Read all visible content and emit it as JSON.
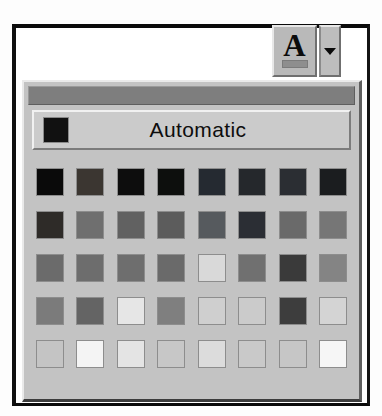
{
  "window": {
    "type": "font-color-palette-dropdown"
  },
  "toolbar": {
    "font_color_button": {
      "glyph": "A",
      "name": "font-color-button",
      "underline_color": "#8e8e8e"
    },
    "dropdown_arrow": {
      "icon": "caret-down-icon"
    }
  },
  "palette": {
    "grip_label": "",
    "automatic": {
      "label": "Automatic",
      "swatch_color": "#111111"
    },
    "grid": {
      "columns": 8,
      "rows": 5,
      "swatches": [
        [
          {
            "color": "#0a0a0a",
            "name": "swatch-black"
          },
          {
            "color": "#3b3631",
            "name": "swatch-dark-brown"
          },
          {
            "color": "#0d0d0d",
            "name": "swatch-olive-dark"
          },
          {
            "color": "#0d0f0d",
            "name": "swatch-dark-green"
          },
          {
            "color": "#252a31",
            "name": "swatch-dark-teal"
          },
          {
            "color": "#25282c",
            "name": "swatch-dark-blue"
          },
          {
            "color": "#2b2e33",
            "name": "swatch-indigo"
          },
          {
            "color": "#1b1d1f",
            "name": "swatch-gray-80"
          }
        ],
        [
          {
            "color": "#2e2b28",
            "name": "swatch-dark-red"
          },
          {
            "color": "#6f6f6f",
            "name": "swatch-orange"
          },
          {
            "color": "#616161",
            "name": "swatch-dark-yellow"
          },
          {
            "color": "#5c5c5c",
            "name": "swatch-green"
          },
          {
            "color": "#565a5e",
            "name": "swatch-teal"
          },
          {
            "color": "#2b2e34",
            "name": "swatch-blue"
          },
          {
            "color": "#6a6a6a",
            "name": "swatch-blue-gray"
          },
          {
            "color": "#767676",
            "name": "swatch-gray-50"
          }
        ],
        [
          {
            "color": "#6b6b6b",
            "name": "swatch-red"
          },
          {
            "color": "#6d6d6d",
            "name": "swatch-light-orange"
          },
          {
            "color": "#6e6e6e",
            "name": "swatch-lime"
          },
          {
            "color": "#6a6a6a",
            "name": "swatch-sea-green"
          },
          {
            "color": "#d9d9d9",
            "name": "swatch-aqua"
          },
          {
            "color": "#707070",
            "name": "swatch-light-blue"
          },
          {
            "color": "#3a3a3a",
            "name": "swatch-violet"
          },
          {
            "color": "#848484",
            "name": "swatch-gray-40"
          }
        ],
        [
          {
            "color": "#7b7b7b",
            "name": "swatch-pink"
          },
          {
            "color": "#646464",
            "name": "swatch-gold"
          },
          {
            "color": "#e6e6e6",
            "name": "swatch-yellow"
          },
          {
            "color": "#7f7f7f",
            "name": "swatch-bright-green"
          },
          {
            "color": "#cfcfcf",
            "name": "swatch-turquoise"
          },
          {
            "color": "#cbcbcb",
            "name": "swatch-sky-blue"
          },
          {
            "color": "#3d3d3d",
            "name": "swatch-plum"
          },
          {
            "color": "#d4d4d4",
            "name": "swatch-gray-25"
          }
        ],
        [
          {
            "color": "#c4c4c4",
            "name": "swatch-rose"
          },
          {
            "color": "#f4f4f4",
            "name": "swatch-tan"
          },
          {
            "color": "#e4e4e4",
            "name": "swatch-light-yellow"
          },
          {
            "color": "#c7c7c7",
            "name": "swatch-light-green"
          },
          {
            "color": "#dcdcdc",
            "name": "swatch-light-turquoise"
          },
          {
            "color": "#c9c9c9",
            "name": "swatch-pale-blue"
          },
          {
            "color": "#c6c6c6",
            "name": "swatch-lavender"
          },
          {
            "color": "#f6f6f6",
            "name": "swatch-white"
          }
        ]
      ]
    }
  }
}
